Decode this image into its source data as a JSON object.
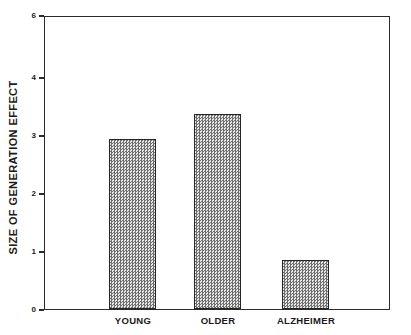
{
  "chart_data": {
    "type": "bar",
    "title": "",
    "subtitle": "",
    "xlabel": "",
    "ylabel": "SIZE OF GENERATION EFFECT",
    "categories": [
      "YOUNG",
      "OLDER",
      "ALZHEIMER"
    ],
    "values": [
      3.5,
      4.0,
      1.0
    ],
    "ylim": [
      0,
      6
    ],
    "xlim_note": "categorical",
    "ytick_labels": [
      "0",
      "1",
      "2",
      "3",
      "4",
      "6"
    ],
    "ytick_values": [
      0,
      1,
      2,
      3,
      4,
      6
    ],
    "grid": false,
    "legend": null,
    "legend_position": "none",
    "annotations": [],
    "series": [
      {
        "name": "Size of generation effect",
        "values": [
          3.5,
          4.0,
          1.0
        ]
      }
    ],
    "style": {
      "bar_fill": "#cfcfcf",
      "bar_edge": "#262626",
      "axis_color": "#2b2b2b",
      "text_color": "#1a1a1a",
      "background": "#ffffff",
      "fill_pattern": "checkerboard-dither"
    }
  },
  "figure": {
    "y_axis_title": "SIZE OF GENERATION EFFECT",
    "ticks": [
      {
        "label": "6"
      },
      {
        "label": "4"
      },
      {
        "label": "3"
      },
      {
        "label": "2"
      },
      {
        "label": "1"
      },
      {
        "label": "0"
      }
    ],
    "bars": [
      {
        "label": "YOUNG",
        "value": "3.5"
      },
      {
        "label": "OLDER",
        "value": "4.0"
      },
      {
        "label": "ALZHEIMER",
        "value": "1.0"
      }
    ]
  }
}
